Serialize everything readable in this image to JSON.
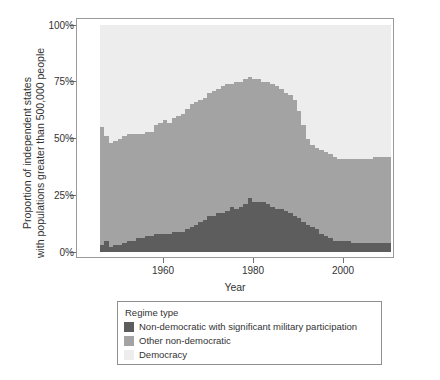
{
  "axes": {
    "ylabel_line1": "Proportion of independent states",
    "ylabel_line2": "with populations greater than 500,000 people",
    "xlabel": "Year",
    "yticks": [
      "0%",
      "25%",
      "50%",
      "75%",
      "100%"
    ],
    "xticks": [
      "1960",
      "1980",
      "2000"
    ]
  },
  "legend": {
    "title": "Regime type",
    "items": [
      {
        "label": "Non-democratic with significant military participation",
        "color": "#5d5d5d"
      },
      {
        "label": "Other non-democratic",
        "color": "#a3a3a3"
      },
      {
        "label": "Democracy",
        "color": "#ededed"
      }
    ]
  },
  "chart_data": {
    "type": "area",
    "title": "",
    "xlabel": "Year",
    "ylabel": "Proportion of independent states with populations greater than 500,000 people",
    "xlim": [
      1945,
      2010
    ],
    "ylim": [
      0,
      100
    ],
    "grid": false,
    "legend_position": "below",
    "stacked": true,
    "units": "percent",
    "x": [
      1945,
      1946,
      1947,
      1948,
      1949,
      1950,
      1951,
      1952,
      1953,
      1954,
      1955,
      1956,
      1957,
      1958,
      1959,
      1960,
      1961,
      1962,
      1963,
      1964,
      1965,
      1966,
      1967,
      1968,
      1969,
      1970,
      1971,
      1972,
      1973,
      1974,
      1975,
      1976,
      1977,
      1978,
      1979,
      1980,
      1981,
      1982,
      1983,
      1984,
      1985,
      1986,
      1987,
      1988,
      1989,
      1990,
      1991,
      1992,
      1993,
      1994,
      1995,
      1996,
      1997,
      1998,
      1999,
      2000,
      2001,
      2002,
      2003,
      2004,
      2005,
      2006,
      2007,
      2008,
      2009,
      2010
    ],
    "series": [
      {
        "name": "Non-democratic with significant military participation",
        "color": "#5d5d5d",
        "values": [
          3,
          5,
          2,
          3,
          3,
          4,
          5,
          5,
          6,
          6,
          7,
          7,
          8,
          8,
          8,
          8,
          9,
          9,
          9,
          10,
          11,
          12,
          13,
          14,
          16,
          16,
          17,
          17,
          18,
          20,
          19,
          20,
          21,
          24,
          22,
          22,
          22,
          21,
          20,
          19,
          19,
          18,
          17,
          16,
          15,
          13,
          12,
          11,
          10,
          8,
          7,
          6,
          5,
          5,
          5,
          5,
          4,
          4,
          4,
          4,
          4,
          4,
          4,
          4,
          4,
          3
        ]
      },
      {
        "name": "Other non-democratic",
        "color": "#a3a3a3",
        "values": [
          52,
          46,
          46,
          46,
          47,
          47,
          47,
          47,
          46,
          46,
          46,
          46,
          48,
          49,
          50,
          49,
          50,
          51,
          52,
          53,
          54,
          54,
          54,
          54,
          54,
          55,
          55,
          56,
          56,
          54,
          56,
          55,
          55,
          53,
          54,
          54,
          53,
          54,
          54,
          54,
          53,
          52,
          52,
          51,
          47,
          43,
          38,
          36,
          36,
          37,
          37,
          37,
          37,
          36,
          36,
          36,
          37,
          37,
          37,
          37,
          37,
          38,
          38,
          38,
          38,
          38
        ]
      },
      {
        "name": "Democracy",
        "color": "#ededed",
        "values": [
          45,
          49,
          52,
          51,
          50,
          49,
          48,
          48,
          48,
          48,
          47,
          47,
          44,
          43,
          42,
          43,
          41,
          40,
          39,
          37,
          35,
          34,
          33,
          32,
          30,
          29,
          28,
          27,
          26,
          26,
          25,
          25,
          24,
          23,
          24,
          24,
          25,
          25,
          26,
          27,
          28,
          30,
          31,
          33,
          38,
          44,
          50,
          53,
          54,
          55,
          56,
          57,
          58,
          59,
          59,
          59,
          59,
          59,
          59,
          59,
          59,
          58,
          58,
          58,
          58,
          59
        ]
      }
    ]
  }
}
